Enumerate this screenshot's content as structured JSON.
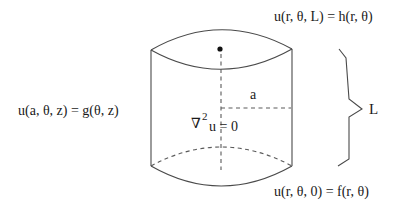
{
  "diagram": {
    "labels": {
      "top_boundary": "u(r, θ, L) = h(r, θ)",
      "side_boundary": "u(a, θ, z) = g(θ, z)",
      "bottom_boundary": "u(r, θ, 0) = f(r, θ)",
      "radius": "a",
      "length": "L",
      "equation_nabla": "∇",
      "equation_exp": "2",
      "equation_rest": "u = 0"
    },
    "colors": {
      "stroke": "#4a4a4a",
      "text": "#1a1a1a",
      "background": "#ffffff"
    }
  }
}
